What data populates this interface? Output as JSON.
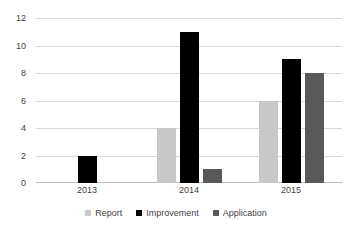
{
  "chart_data": {
    "type": "bar",
    "title": "",
    "xlabel": "",
    "ylabel": "",
    "categories": [
      "2013",
      "2014",
      "2015"
    ],
    "series": [
      {
        "name": "Report",
        "color": "#c8c8c8",
        "values": [
          null,
          4,
          6
        ]
      },
      {
        "name": "Improvement",
        "color": "#000000",
        "values": [
          2,
          11,
          9
        ]
      },
      {
        "name": "Application",
        "color": "#595959",
        "values": [
          null,
          1,
          8
        ]
      }
    ],
    "ylim": [
      0,
      12
    ],
    "y_ticks": [
      0,
      2,
      4,
      6,
      8,
      10,
      12
    ],
    "y_tick_labels": [
      "0",
      "2",
      "4",
      "6",
      "8",
      "10",
      "12"
    ],
    "grid": true,
    "grid_color": "#d9d9d9",
    "legend_position": "bottom-center",
    "background": "#ffffff"
  },
  "legend": {
    "entries": [
      {
        "label": "Report"
      },
      {
        "label": "Improvement"
      },
      {
        "label": "Application"
      }
    ]
  },
  "axes": {
    "y_labels": [
      "12",
      "10",
      "8",
      "6",
      "4",
      "2",
      "0"
    ],
    "x_labels": [
      "2013",
      "2014",
      "2015"
    ]
  }
}
